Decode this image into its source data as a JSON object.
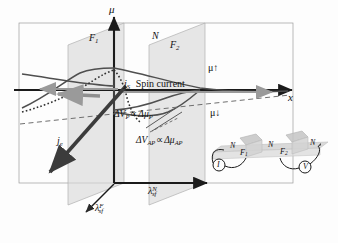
{
  "figure": {
    "type": "physics-schematic",
    "axes": {
      "vertical_label": "μ",
      "horizontal_label": "x",
      "depth_axis": "in-plane depth axis"
    },
    "region_labels": [
      {
        "id": "f1",
        "text": "F",
        "subscript": "1"
      },
      {
        "id": "n",
        "text": "N",
        "subscript": ""
      },
      {
        "id": "f2",
        "text": "F",
        "subscript": "2"
      }
    ],
    "chemical_potentials": [
      {
        "id": "mu-up",
        "text": "μ↑"
      },
      {
        "id": "mu-down",
        "text": "μ↓"
      }
    ],
    "annotations": [
      {
        "id": "spin-current",
        "symbol": "j",
        "symbol_sub": "S",
        "text": "Spin current"
      },
      {
        "id": "charge-current",
        "symbol": "j",
        "symbol_sub": "e",
        "text": ""
      },
      {
        "id": "delta-v-p",
        "text": "ΔV",
        "sub1": "P",
        "rel": "∝",
        "text2": "Δμ",
        "sub2": "P"
      },
      {
        "id": "delta-v-ap",
        "text": "ΔV",
        "sub1": "AP",
        "rel": "∝",
        "text2": "Δμ",
        "sub2": "AP"
      }
    ],
    "spin_diffusion_lengths": [
      {
        "id": "lambda-sf-f",
        "symbol": "λ",
        "sub": "sf",
        "sup": "F"
      },
      {
        "id": "lambda-sf-n",
        "symbol": "λ",
        "sub": "sf",
        "sup": "N"
      }
    ],
    "inset": {
      "name": "lateral spin valve circuit",
      "wire_labels": [
        {
          "id": "inset-n-left",
          "text": "N"
        },
        {
          "id": "inset-f1",
          "text": "F",
          "sub": "1"
        },
        {
          "id": "inset-n-middle",
          "text": "N"
        },
        {
          "id": "inset-f2",
          "text": "F",
          "sub": "2"
        },
        {
          "id": "inset-n-right",
          "text": "N"
        }
      ],
      "instruments": [
        {
          "id": "current-source",
          "text": "I"
        },
        {
          "id": "voltmeter",
          "text": "V"
        }
      ]
    },
    "colors": {
      "axis": "#1b1b1b",
      "plane_fill": "#d9d9d9",
      "plane_edge": "#a8a8a8",
      "frame": "#8d8d8d",
      "curve": "#555555",
      "dashed": "#6b6b6b",
      "arrow_gray": "#9a9a9a",
      "inset_wire": "#c9c9c9"
    }
  }
}
